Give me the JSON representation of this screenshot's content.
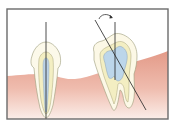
{
  "diagram": {
    "title": "Tooth long axis: upright vs tilted tooth",
    "colors": {
      "frame": "#6b6b6b",
      "background": "#ffffff",
      "gum": "#e8a596",
      "gum_light": "#f6ddd5",
      "enamel": "#fbf7e3",
      "dentin": "#f4efc8",
      "pulp": "#bcd6ea",
      "outline": "#8a8a6a",
      "axis_line": "#2a2a2a"
    },
    "elements": [
      {
        "id": "upright-tooth",
        "label": "Upright single-root tooth with vertical axis"
      },
      {
        "id": "tilted-molar",
        "label": "Tilted molar with rotated axis"
      },
      {
        "id": "rotation-arrow",
        "label": "Rotation direction arrow"
      },
      {
        "id": "gingiva",
        "label": "Gum tissue"
      }
    ]
  }
}
